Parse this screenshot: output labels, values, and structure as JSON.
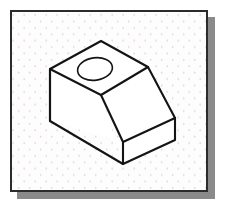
{
  "page": {
    "width": 225,
    "height": 212,
    "background_color": "#ffffff",
    "kind": "technical-illustration",
    "caption": ""
  },
  "panel": {
    "name": "isometric-grid-sheet",
    "x": 10,
    "y": 10,
    "width": 198,
    "height": 182,
    "fill_color": "#fdfdfd",
    "border_color": "#2b2b2b",
    "border_width": 2,
    "shadow_color": "#8a8a8a",
    "shadow_offset_x": 7,
    "shadow_offset_y": 7
  },
  "grid": {
    "name": "isometric-dot-grid",
    "dot_color": "#e7d7d7",
    "dot_radius": 0.9,
    "column_spacing": 11,
    "row_spacing": 6.4,
    "stagger": true
  },
  "drawing": {
    "title": "Isometric wedge block with counterbored hole",
    "line_color": "#141414",
    "face_fill": "#ffffff",
    "outline_width": 2.1,
    "inner_width": 1.6,
    "hole": {
      "name": "top-face-circular-hole",
      "center_x": 95,
      "center_y": 69,
      "radius_x": 17.5,
      "radius_y": 11.2,
      "rotation_deg": -8,
      "stroke_width": 1.6
    },
    "vertices": {
      "top_apex": [
        101,
        41
      ],
      "top_left": [
        50,
        69
      ],
      "top_right": [
        148,
        67
      ],
      "slope_top_left": [
        50,
        69
      ],
      "slope_mid": [
        101,
        95
      ],
      "left_front_bottom": [
        50,
        121
      ],
      "front_bottom_apex": [
        123,
        164
      ],
      "right_upper": [
        175,
        118
      ],
      "right_lower": [
        175,
        140
      ],
      "front_slope_bottom_left": [
        123,
        142
      ]
    },
    "faces": [
      {
        "name": "top-face",
        "points": "50,69 101,41 148,67 101,95"
      },
      {
        "name": "left-side-face",
        "points": "50,69 101,95 123,164 123,142 50,121"
      },
      {
        "name": "sloped-front-face",
        "points": "101,95 148,67 175,118 123,142"
      },
      {
        "name": "right-side-face",
        "points": "123,142 175,118 175,140 123,164"
      }
    ]
  }
}
